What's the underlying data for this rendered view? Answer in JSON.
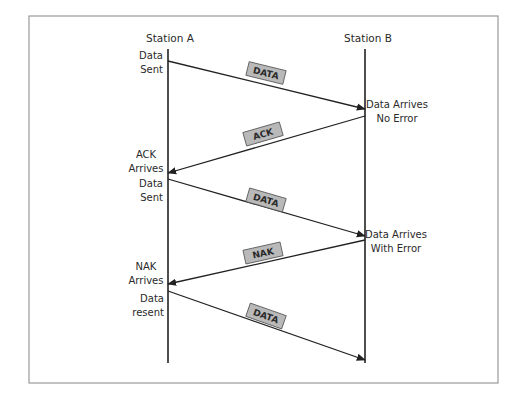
{
  "colors": {
    "frame": "#9a9a9a",
    "line": "#222222",
    "label_fill": "#b9b9b9",
    "label_border": "#555555",
    "text": "#2a2a2a"
  },
  "frame": {
    "x": 29,
    "y": 16,
    "w": 469,
    "h": 367
  },
  "stations": [
    {
      "id": "a",
      "title": "Station A",
      "x": 168,
      "y_top": 49,
      "y_bottom": 363,
      "title_x": 170,
      "title_y": 42
    },
    {
      "id": "b",
      "title": "Station B",
      "x": 365,
      "y_top": 49,
      "y_bottom": 363,
      "title_x": 368,
      "title_y": 42
    }
  ],
  "messages": [
    {
      "label": "DATA",
      "from": "a",
      "to": "b",
      "y_from": 61,
      "y_to": 109,
      "label_cx": 266,
      "label_cy": 73
    },
    {
      "label": "ACK",
      "from": "b",
      "to": "a",
      "y_from": 116,
      "y_to": 173,
      "label_cx": 263,
      "label_cy": 134
    },
    {
      "label": "DATA",
      "from": "a",
      "to": "b",
      "y_from": 179,
      "y_to": 236,
      "label_cx": 266,
      "label_cy": 200
    },
    {
      "label": "NAK",
      "from": "b",
      "to": "a",
      "y_from": 240,
      "y_to": 284,
      "label_cx": 263,
      "label_cy": 253
    },
    {
      "label": "DATA",
      "from": "a",
      "to": "b",
      "y_from": 291,
      "y_to": 360,
      "label_cx": 266,
      "label_cy": 316
    }
  ],
  "events": [
    {
      "station": "a",
      "lines": [
        "Data",
        "Sent"
      ],
      "x": 163,
      "y": 59,
      "anchor": "end"
    },
    {
      "station": "b",
      "lines": [
        "Data Arrives",
        "No Error"
      ],
      "x": 397,
      "y": 108,
      "anchor": "middle"
    },
    {
      "station": "a",
      "lines": [
        "ACK",
        "Arrives"
      ],
      "x": 146,
      "y": 158,
      "anchor": "middle"
    },
    {
      "station": "a",
      "lines": [
        "Data",
        "Sent"
      ],
      "x": 163,
      "y": 187,
      "anchor": "end"
    },
    {
      "station": "b",
      "lines": [
        "Data Arrives",
        "With Error"
      ],
      "x": 396,
      "y": 238,
      "anchor": "middle"
    },
    {
      "station": "a",
      "lines": [
        "NAK",
        "Arrives"
      ],
      "x": 146,
      "y": 270,
      "anchor": "middle"
    },
    {
      "station": "a",
      "lines": [
        "Data",
        "resent"
      ],
      "x": 164,
      "y": 302,
      "anchor": "end"
    }
  ],
  "label_box": {
    "w": 38,
    "h": 14
  }
}
